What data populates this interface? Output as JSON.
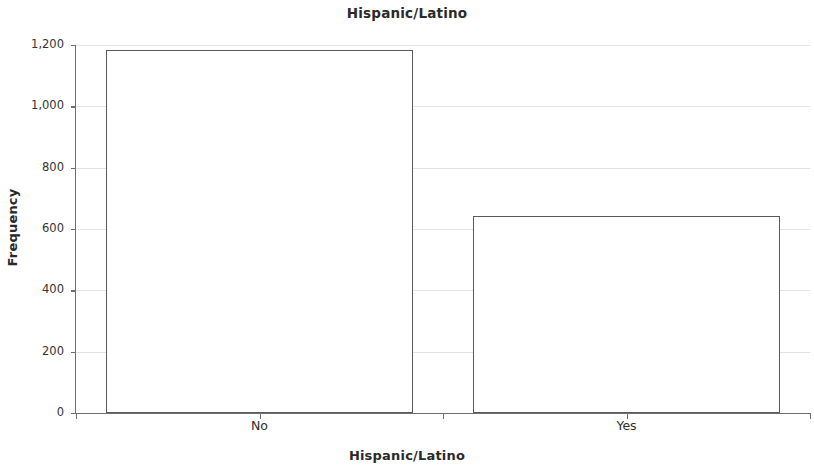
{
  "chart_data": {
    "type": "bar",
    "title": "Hispanic/Latino",
    "xlabel": "Hispanic/Latino",
    "ylabel": "Frequency",
    "categories": [
      "No",
      "Yes"
    ],
    "values": [
      1185,
      644
    ],
    "series": [
      {
        "name": "Frequency",
        "values": [
          1185,
          644
        ]
      }
    ],
    "ylim": [
      0,
      1240
    ],
    "ytick_values": [
      0,
      200,
      400,
      600,
      800,
      1000,
      1200
    ],
    "ytick_labels": [
      "0",
      "200",
      "400",
      "600",
      "800",
      "1,000",
      "1,200"
    ],
    "grid": true,
    "grid_axis": "y",
    "legend": false,
    "bar_fill_color": "#ffffff",
    "bar_edge_color": "#5a5a5a",
    "gridline_color": "#e2e2e4",
    "axis_color": "#6f6f6f",
    "background_color": "#ffffff"
  }
}
